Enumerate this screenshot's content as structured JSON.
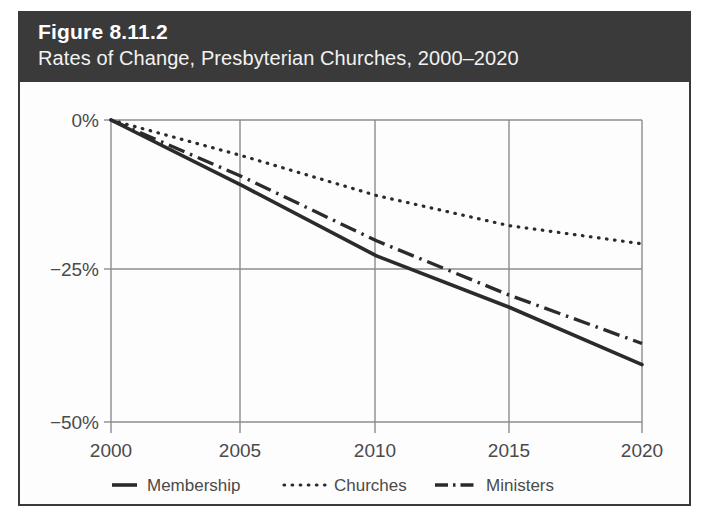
{
  "figure": {
    "number_label": "Figure 8.11.2",
    "subtitle": "Rates of Change, Presbyterian Churches, 2000–2020",
    "header_bg": "#3a3a3a",
    "header_text_color": "#ffffff",
    "border_color": "#3a3a3a",
    "page_bg": "#ffffff"
  },
  "chart_data": {
    "type": "line",
    "title": "Rates of Change, Presbyterian Churches, 2000–2020",
    "xlabel": "",
    "ylabel": "",
    "x": [
      2000,
      2005,
      2010,
      2015,
      2020
    ],
    "categories": [
      "2000",
      "2005",
      "2010",
      "2015",
      "2020"
    ],
    "xtick_labels": [
      "2000",
      "2005",
      "2010",
      "2015",
      "2020"
    ],
    "ytick_labels": [
      "0%",
      "−25%",
      "−50%"
    ],
    "ytick_values": [
      0,
      -25,
      -50
    ],
    "xlim": [
      2000,
      2020
    ],
    "ylim": [
      -50,
      0
    ],
    "grid": "both",
    "legend_position": "bottom",
    "line_color": "#2b2b2b",
    "grid_color": "#8c8c8c",
    "series": [
      {
        "name": "Membership",
        "style": "solid",
        "values": [
          0,
          -11.0,
          -22.5,
          -31.0,
          -40.5
        ]
      },
      {
        "name": "Churches",
        "style": "dotted",
        "values": [
          0,
          -6.0,
          -12.5,
          -17.5,
          -20.5
        ]
      },
      {
        "name": "Ministers",
        "style": "dash-dot",
        "values": [
          0,
          -9.5,
          -20.0,
          -29.0,
          -37.0
        ]
      }
    ]
  },
  "legend": {
    "items": [
      {
        "label": "Membership",
        "style": "solid"
      },
      {
        "label": "Churches",
        "style": "dotted"
      },
      {
        "label": "Ministers",
        "style": "dash-dot"
      }
    ]
  }
}
